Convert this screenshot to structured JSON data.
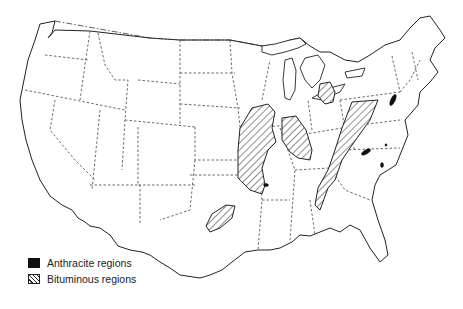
{
  "map": {
    "subject": "Coal regions of the contiguous United States",
    "colors": {
      "anthracite": "#111111",
      "bituminous_hatch": "#222222",
      "background": "#ffffff"
    }
  },
  "legend": {
    "items": [
      {
        "label": "Anthracite regions",
        "icon": "solid-black-swatch"
      },
      {
        "label": "Bituminous regions",
        "icon": "hatched-swatch"
      }
    ]
  }
}
